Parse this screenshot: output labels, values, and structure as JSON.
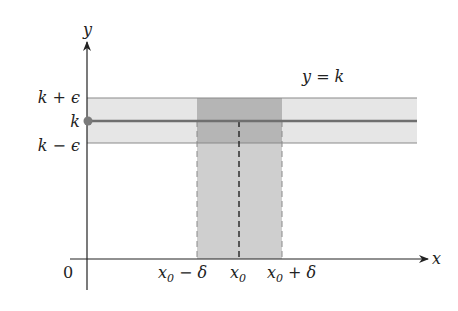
{
  "diagram": {
    "type": "epsilon-delta limit of a constant function",
    "colors": {
      "band_fill": "#e6e6e6",
      "strip_fill": "#cfcfcf",
      "overlap_fill": "#b5b5b5",
      "band_lines": "#8a8a8a",
      "constant_line": "#6f6f6f",
      "point": "#7a7a7a",
      "axis": "#222222"
    },
    "axes": {
      "x_label": "x",
      "y_label": "y",
      "origin_label": "0"
    },
    "y_ticks": {
      "upper": "k + ϵ",
      "center": "k",
      "lower": "k − ϵ"
    },
    "x_ticks": {
      "left": {
        "base": "x",
        "sub": "0",
        "rest": " − δ"
      },
      "center": {
        "base": "x",
        "sub": "0"
      },
      "right": {
        "base": "x",
        "sub": "0",
        "rest": " + δ"
      }
    },
    "line_label": "y = k"
  }
}
